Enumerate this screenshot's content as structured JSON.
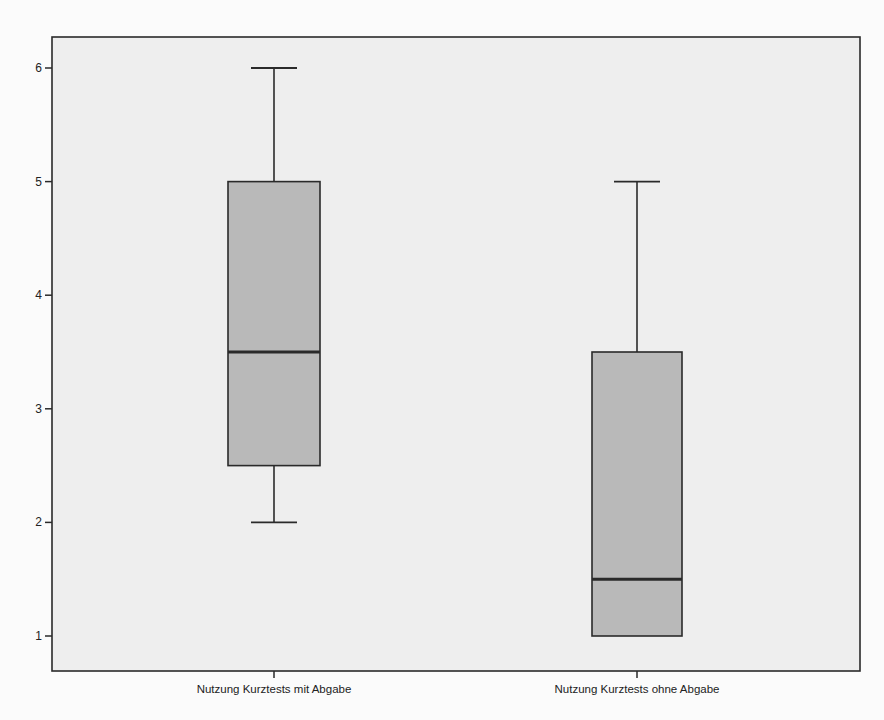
{
  "chart_data": {
    "type": "boxplot",
    "title": "",
    "xlabel": "",
    "ylabel": "",
    "ylim": [
      0.7,
      6.3
    ],
    "yticks": [
      1,
      2,
      3,
      4,
      5,
      6
    ],
    "grid": false,
    "legend": null,
    "categories": [
      "Nutzung Kurztests mit Abgabe",
      "Nutzung Kurztests ohne Abgabe"
    ],
    "series": [
      {
        "name": "Nutzung Kurztests mit Abgabe",
        "min": 2,
        "q1": 2.5,
        "median": 3.5,
        "q3": 5,
        "max": 6
      },
      {
        "name": "Nutzung Kurztests ohne Abgabe",
        "min": 1,
        "q1": 1,
        "median": 1.5,
        "q3": 3.5,
        "max": 5
      }
    ]
  },
  "colors": {
    "plot_background": "#eeeeee",
    "box_fill": "#b9b9b9",
    "lines": "#2a2a2a"
  }
}
